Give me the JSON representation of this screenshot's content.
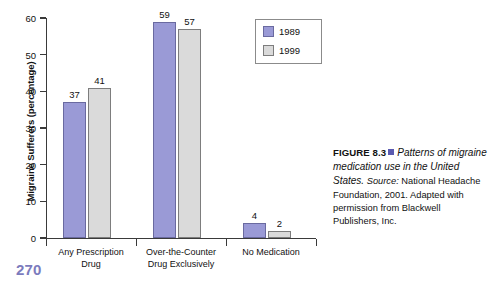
{
  "chart_data": {
    "type": "bar",
    "title": "",
    "xlabel": "",
    "ylabel": "Migraine Sufferers (percentage)",
    "ylim": [
      0,
      60
    ],
    "yticks": [
      0,
      10,
      20,
      30,
      40,
      50,
      60
    ],
    "grid": false,
    "legend_position": "top-right",
    "categories": [
      "Any Prescription\nDrug",
      "Over-the-Counter\nDrug Exclusively",
      "No Medication"
    ],
    "series": [
      {
        "name": "1989",
        "color": "#9a9ad6",
        "values": [
          37,
          59,
          4
        ]
      },
      {
        "name": "1999",
        "color": "#dadada",
        "values": [
          41,
          57,
          2
        ]
      }
    ]
  },
  "legend": {
    "entries": [
      {
        "label": "1989",
        "swatch": "series-1989-swatch"
      },
      {
        "label": "1999",
        "swatch": "series-1999-swatch"
      }
    ]
  },
  "caption": {
    "figure_label": "FIGURE 8.3",
    "title": "Patterns of migraine medication use in the United States.",
    "source_label": "Source:",
    "source_text": " National Headache Foundation, 2001. Adapted with permission from Blackwell Publishers, Inc."
  },
  "page": {
    "number": "270"
  }
}
